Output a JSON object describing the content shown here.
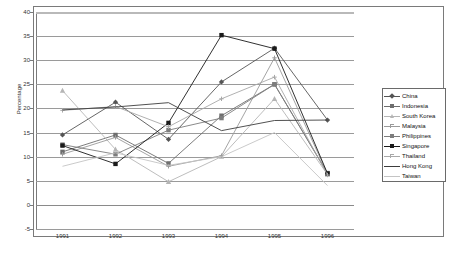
{
  "chart_data": {
    "type": "line",
    "title": "",
    "xlabel": "",
    "ylabel": "Percentage",
    "categories": [
      "1991",
      "1992",
      "1993",
      "1994",
      "1995",
      "1996"
    ],
    "x": [
      1991,
      1992,
      1993,
      1994,
      1995,
      1996
    ],
    "ylim": [
      -5,
      40
    ],
    "ytick_values": [
      40,
      35,
      30,
      25,
      20,
      15,
      10,
      5,
      0,
      -5
    ],
    "ytick_labels": [
      "40",
      "35",
      "30",
      "25",
      "20",
      "15",
      "10",
      "5",
      "0",
      "-5"
    ],
    "grid": true,
    "legend_position": "right",
    "series": [
      {
        "name": "China",
        "marker": "diamond",
        "color": "#555555",
        "values": [
          14.5,
          21.3,
          13.6,
          25.5,
          32.5,
          17.6
        ]
      },
      {
        "name": "Indonesia",
        "marker": "square",
        "color": "#6e6e6e",
        "values": [
          11.0,
          14.5,
          8.6,
          18.5,
          25.0,
          6.6
        ]
      },
      {
        "name": "South Korea",
        "marker": "triangle",
        "color": "#b5b5b5",
        "values": [
          23.7,
          11.5,
          4.8,
          10.0,
          22.0,
          6.3
        ]
      },
      {
        "name": "Malaysia",
        "marker": "cross",
        "color": "#9a9a9a",
        "values": [
          10.5,
          14.0,
          8.0,
          10.2,
          30.5,
          6.4
        ]
      },
      {
        "name": "Philippines",
        "marker": "square",
        "color": "#7d7d7d",
        "values": [
          12.5,
          10.5,
          15.5,
          18.0,
          25.0,
          6.5
        ]
      },
      {
        "name": "Singapore",
        "marker": "square",
        "color": "#1a1a1a",
        "values": [
          12.3,
          8.5,
          17.0,
          35.2,
          32.4,
          6.5
        ]
      },
      {
        "name": "Thailand",
        "marker": "plus",
        "color": "#a8a8a8",
        "values": [
          19.6,
          20.4,
          16.2,
          22.0,
          26.5,
          6.2
        ]
      },
      {
        "name": "Hong Kong",
        "marker": "line",
        "color": "#3d3d3d",
        "values": [
          19.7,
          20.3,
          21.2,
          15.4,
          17.5,
          17.6
        ]
      },
      {
        "name": "Taiwan",
        "marker": "line",
        "color": "#c4c4c4",
        "values": [
          8.0,
          10.8,
          8.2,
          10.0,
          15.0,
          4.0
        ]
      }
    ]
  },
  "legend": {
    "items": [
      {
        "label": "China"
      },
      {
        "label": "Indonesia"
      },
      {
        "label": "South Korea"
      },
      {
        "label": "Malaysia"
      },
      {
        "label": "Philippines"
      },
      {
        "label": "Singapore"
      },
      {
        "label": "Thailand"
      },
      {
        "label": "Hong Kong"
      },
      {
        "label": "Taiwan"
      }
    ]
  },
  "axes": {
    "y_title": "Percentage"
  }
}
